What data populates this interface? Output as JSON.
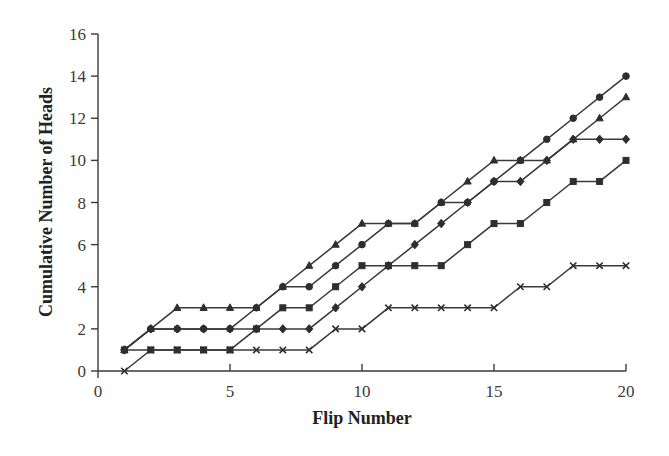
{
  "chart_data": {
    "type": "line",
    "title": "",
    "xlabel": "Flip Number",
    "ylabel": "Cumulative Number of Heads",
    "xlim": [
      0,
      20
    ],
    "ylim": [
      0,
      16
    ],
    "x_ticks": [
      0,
      5,
      10,
      15,
      20
    ],
    "y_ticks": [
      0,
      2,
      4,
      6,
      8,
      10,
      12,
      14,
      16
    ],
    "grid": false,
    "legend": "none",
    "x": [
      1,
      2,
      3,
      4,
      5,
      6,
      7,
      8,
      9,
      10,
      11,
      12,
      13,
      14,
      15,
      16,
      17,
      18,
      19,
      20
    ],
    "series": [
      {
        "name": "Series (circle markers)",
        "marker": "circle",
        "values": [
          1,
          2,
          2,
          2,
          2,
          3,
          4,
          4,
          5,
          6,
          7,
          7,
          8,
          8,
          9,
          10,
          11,
          12,
          13,
          14
        ]
      },
      {
        "name": "Series (triangle markers)",
        "marker": "triangle",
        "values": [
          1,
          2,
          3,
          3,
          3,
          3,
          4,
          5,
          6,
          7,
          7,
          7,
          8,
          9,
          10,
          10,
          10,
          11,
          12,
          13
        ]
      },
      {
        "name": "Series (diamond markers)",
        "marker": "diamond",
        "values": [
          1,
          2,
          2,
          2,
          2,
          2,
          2,
          2,
          3,
          4,
          5,
          6,
          7,
          8,
          9,
          9,
          10,
          11,
          11,
          11
        ]
      },
      {
        "name": "Series (square markers)",
        "marker": "square",
        "values": [
          1,
          1,
          1,
          1,
          1,
          2,
          3,
          3,
          4,
          5,
          5,
          5,
          5,
          6,
          7,
          7,
          8,
          9,
          9,
          10
        ]
      },
      {
        "name": "Series (x markers)",
        "marker": "x",
        "values": [
          0,
          1,
          1,
          1,
          1,
          1,
          1,
          1,
          2,
          2,
          3,
          3,
          3,
          3,
          3,
          4,
          4,
          5,
          5,
          5
        ]
      }
    ]
  },
  "colors": {
    "line": "#3a3a3a",
    "marker": "#2e2e2e",
    "background": "#ffffff"
  }
}
